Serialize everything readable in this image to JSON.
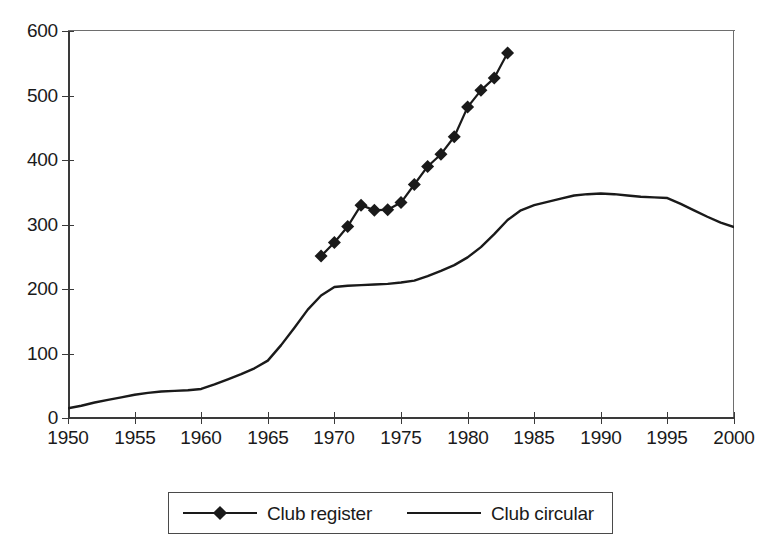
{
  "chart_data": {
    "type": "line",
    "title": "",
    "xlabel": "",
    "ylabel": "",
    "xlim": [
      1950,
      2000
    ],
    "ylim": [
      0,
      600
    ],
    "ytick_values": [
      0,
      100,
      200,
      300,
      400,
      500,
      600
    ],
    "ytick_labels": [
      "0",
      "100",
      "200",
      "300",
      "400",
      "500",
      "600"
    ],
    "xtick_values": [
      1950,
      1955,
      1960,
      1965,
      1970,
      1975,
      1980,
      1985,
      1990,
      1995,
      2000
    ],
    "xtick_labels": [
      "1950",
      "1955",
      "1960",
      "1965",
      "1970",
      "1975",
      "1980",
      "1985",
      "1990",
      "1995",
      "2000"
    ],
    "grid": false,
    "legend_position": "bottom",
    "series": [
      {
        "name": "Club register",
        "marker": "diamond",
        "color": "#1a1a1a",
        "x": [
          1969,
          1970,
          1971,
          1972,
          1973,
          1974,
          1975,
          1976,
          1977,
          1978,
          1979,
          1980,
          1981,
          1982,
          1983
        ],
        "values": [
          251,
          272,
          297,
          330,
          322,
          323,
          334,
          362,
          390,
          409,
          436,
          482,
          508,
          527,
          566
        ]
      },
      {
        "name": "Club circular",
        "marker": "none",
        "color": "#1a1a1a",
        "x": [
          1950,
          1951,
          1952,
          1953,
          1954,
          1955,
          1956,
          1957,
          1958,
          1959,
          1960,
          1961,
          1962,
          1963,
          1964,
          1965,
          1966,
          1967,
          1968,
          1969,
          1970,
          1971,
          1972,
          1973,
          1974,
          1975,
          1976,
          1977,
          1978,
          1979,
          1980,
          1981,
          1982,
          1983,
          1984,
          1985,
          1986,
          1987,
          1988,
          1989,
          1990,
          1991,
          1992,
          1993,
          1994,
          1995,
          1996,
          1997,
          1998,
          1999,
          2000
        ],
        "values": [
          15,
          19,
          24,
          28,
          32,
          36,
          39,
          41,
          42,
          43,
          45,
          52,
          60,
          68,
          77,
          89,
          113,
          140,
          168,
          190,
          203,
          205,
          206,
          207,
          208,
          210,
          213,
          220,
          228,
          237,
          249,
          265,
          285,
          307,
          322,
          330,
          335,
          340,
          345,
          347,
          348,
          347,
          345,
          343,
          342,
          341,
          332,
          322,
          312,
          303,
          296
        ]
      }
    ]
  },
  "legend": {
    "items": [
      {
        "label": "Club register"
      },
      {
        "label": "Club circular"
      }
    ]
  }
}
